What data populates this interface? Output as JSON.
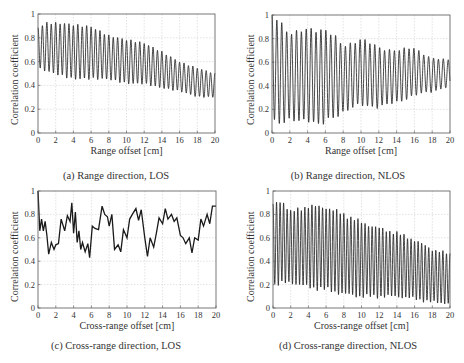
{
  "figure": {
    "panels": [
      {
        "id": "a",
        "caption": "(a)  Range direction, LOS",
        "xlabel": "Range offset [cm]",
        "ylabel": "Correlation coefficient"
      },
      {
        "id": "b",
        "caption": "(b)  Range direction, NLOS",
        "xlabel": "Range offset [cm]",
        "ylabel": "Correlation coefficient"
      },
      {
        "id": "c",
        "caption": "(c)  Cross-range direction, LOS",
        "xlabel": "Cross-range offset [cm]",
        "ylabel": "Correlation coefficient"
      },
      {
        "id": "d",
        "caption": "(d)  Cross-range direction, NLOS",
        "xlabel": "Cross-range offset [cm]",
        "ylabel": "Correlation coefficient"
      }
    ]
  },
  "chart_data": [
    {
      "type": "line",
      "panel": "a",
      "title": "(a) Range direction, LOS",
      "xlabel": "Range offset [cm]",
      "ylabel": "Correlation coefficient",
      "xlim": [
        0,
        20
      ],
      "ylim": [
        0,
        1
      ],
      "grid": true,
      "xticks": [
        0,
        2,
        4,
        6,
        8,
        10,
        12,
        14,
        16,
        18,
        20
      ],
      "yticks": [
        0,
        0.2,
        0.4,
        0.6,
        0.8,
        1
      ],
      "oscillation": {
        "period_cm": 0.5,
        "envelope_upper": [
          [
            0,
            0.88
          ],
          [
            1,
            0.92
          ],
          [
            3,
            0.92
          ],
          [
            6,
            0.9
          ],
          [
            8,
            0.82
          ],
          [
            10,
            0.78
          ],
          [
            12,
            0.75
          ],
          [
            14,
            0.68
          ],
          [
            16,
            0.6
          ],
          [
            18,
            0.55
          ],
          [
            20,
            0.5
          ]
        ],
        "envelope_lower": [
          [
            0,
            0.55
          ],
          [
            2,
            0.5
          ],
          [
            4,
            0.45
          ],
          [
            6,
            0.45
          ],
          [
            8,
            0.45
          ],
          [
            10,
            0.42
          ],
          [
            12,
            0.42
          ],
          [
            14,
            0.38
          ],
          [
            16,
            0.35
          ],
          [
            18,
            0.3
          ],
          [
            20,
            0.3
          ]
        ]
      }
    },
    {
      "type": "line",
      "panel": "b",
      "title": "(b) Range direction, NLOS",
      "xlabel": "Range offset [cm]",
      "ylabel": "Correlation coefficient",
      "xlim": [
        0,
        20
      ],
      "ylim": [
        0,
        1
      ],
      "grid": true,
      "xticks": [
        0,
        2,
        4,
        6,
        8,
        10,
        12,
        14,
        16,
        18,
        20
      ],
      "yticks": [
        0,
        0.2,
        0.4,
        0.6,
        0.8,
        1
      ],
      "oscillation": {
        "period_cm": 0.55,
        "envelope_upper": [
          [
            0,
            1.0
          ],
          [
            1,
            0.93
          ],
          [
            2,
            0.85
          ],
          [
            4,
            0.87
          ],
          [
            6,
            0.88
          ],
          [
            7,
            0.82
          ],
          [
            8,
            0.73
          ],
          [
            10,
            0.8
          ],
          [
            12,
            0.72
          ],
          [
            14,
            0.7
          ],
          [
            16,
            0.72
          ],
          [
            18,
            0.63
          ],
          [
            20,
            0.62
          ]
        ],
        "envelope_lower": [
          [
            0,
            0.12
          ],
          [
            1,
            0.08
          ],
          [
            2,
            0.1
          ],
          [
            4,
            0.12
          ],
          [
            5.5,
            0.05
          ],
          [
            6,
            0.1
          ],
          [
            8,
            0.18
          ],
          [
            10,
            0.24
          ],
          [
            12,
            0.22
          ],
          [
            14,
            0.26
          ],
          [
            16,
            0.32
          ],
          [
            18,
            0.35
          ],
          [
            20,
            0.4
          ]
        ]
      }
    },
    {
      "type": "line",
      "panel": "c",
      "title": "(c) Cross-range direction, LOS",
      "xlabel": "Cross-range offset [cm]",
      "ylabel": "Correlation coefficient",
      "xlim": [
        0,
        20
      ],
      "ylim": [
        0,
        1
      ],
      "grid": true,
      "xticks": [
        0,
        2,
        4,
        6,
        8,
        10,
        12,
        14,
        16,
        18,
        20
      ],
      "yticks": [
        0,
        0.2,
        0.4,
        0.6,
        0.8,
        1
      ],
      "x": [
        0,
        0.2,
        0.4,
        0.6,
        0.8,
        1.0,
        1.2,
        1.5,
        1.8,
        2.0,
        2.3,
        2.6,
        3.0,
        3.3,
        3.6,
        3.8,
        4.0,
        4.2,
        4.4,
        4.6,
        4.8,
        5.0,
        5.3,
        5.6,
        5.8,
        6.1,
        6.4,
        6.8,
        7.2,
        7.5,
        7.8,
        8.0,
        8.3,
        8.6,
        9.0,
        9.3,
        9.6,
        10.0,
        10.3,
        10.6,
        11.0,
        11.3,
        11.6,
        12.0,
        12.3,
        12.6,
        13.0,
        13.3,
        13.6,
        14.0,
        14.3,
        14.6,
        15.0,
        15.3,
        15.6,
        16.0,
        16.3,
        16.6,
        17.0,
        17.3,
        17.6,
        18.0,
        18.3,
        18.6,
        19.0,
        19.3,
        19.6,
        20.0
      ],
      "values": [
        1.0,
        0.66,
        0.76,
        0.66,
        0.74,
        0.62,
        0.46,
        0.56,
        0.5,
        0.54,
        0.55,
        0.76,
        0.66,
        0.79,
        0.74,
        0.9,
        0.64,
        0.82,
        0.56,
        0.66,
        0.5,
        0.56,
        0.48,
        0.55,
        0.43,
        0.7,
        0.68,
        0.67,
        0.87,
        0.8,
        0.78,
        0.7,
        0.8,
        0.5,
        0.54,
        0.48,
        0.67,
        0.6,
        0.76,
        0.8,
        0.85,
        0.75,
        0.84,
        0.6,
        0.44,
        0.6,
        0.52,
        0.64,
        0.77,
        0.72,
        0.85,
        0.76,
        0.8,
        0.74,
        0.77,
        0.62,
        0.6,
        0.55,
        0.6,
        0.47,
        0.6,
        0.58,
        0.76,
        0.7,
        0.8,
        0.72,
        0.87,
        0.87
      ]
    },
    {
      "type": "line",
      "panel": "d",
      "title": "(d) Cross-range direction, NLOS",
      "xlabel": "Cross-range offset [cm]",
      "ylabel": "Correlation coefficient",
      "xlim": [
        0,
        20
      ],
      "ylim": [
        0,
        1
      ],
      "grid": true,
      "xticks": [
        0,
        2,
        4,
        6,
        8,
        10,
        12,
        14,
        16,
        18,
        20
      ],
      "yticks": [
        0,
        0.2,
        0.4,
        0.6,
        0.8,
        1
      ],
      "oscillation": {
        "period_cm": 0.4,
        "envelope_upper": [
          [
            0,
            0.88
          ],
          [
            1,
            0.92
          ],
          [
            2,
            0.82
          ],
          [
            4,
            0.87
          ],
          [
            6,
            0.86
          ],
          [
            8,
            0.8
          ],
          [
            10,
            0.73
          ],
          [
            12,
            0.68
          ],
          [
            14,
            0.64
          ],
          [
            16,
            0.58
          ],
          [
            18,
            0.5
          ],
          [
            20,
            0.46
          ]
        ],
        "envelope_lower": [
          [
            0,
            0.2
          ],
          [
            2,
            0.22
          ],
          [
            4,
            0.18
          ],
          [
            6,
            0.16
          ],
          [
            8,
            0.12
          ],
          [
            10,
            0.1
          ],
          [
            12,
            0.1
          ],
          [
            14,
            0.1
          ],
          [
            16,
            0.08
          ],
          [
            18,
            0.05
          ],
          [
            20,
            0.04
          ]
        ]
      }
    }
  ]
}
